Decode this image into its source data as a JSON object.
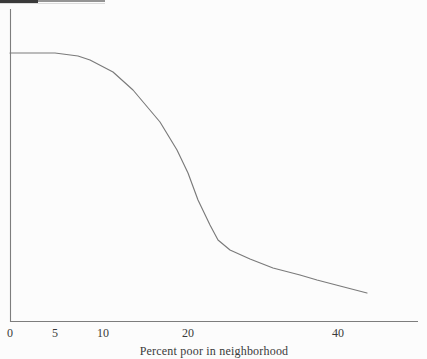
{
  "figure": {
    "background": "#fcfcfc",
    "axes_color": "#7d7d7d",
    "curve_color": "#7a7a7a",
    "text_color": "#3a3a3a",
    "xlabel": "Percent poor in neighborhood",
    "x_ticks": [
      {
        "label": "0",
        "x_px": 10
      },
      {
        "label": "5",
        "x_px": 55
      },
      {
        "label": "10",
        "x_px": 103
      },
      {
        "label": "20",
        "x_px": 188
      },
      {
        "label": "40",
        "x_px": 338
      }
    ],
    "artifact": {
      "dark_color": "#3a3a3a",
      "light_color": "#949494",
      "underline_color": "#dcdcdc"
    },
    "plot": {
      "y_axis": {
        "x_px": 10,
        "y1_px": 9,
        "y2_px": 322
      },
      "x_axis": {
        "y_px": 321,
        "x1_px": 10,
        "x2_px": 418
      },
      "curve_px": [
        [
          10,
          53
        ],
        [
          55,
          53
        ],
        [
          78,
          56
        ],
        [
          90,
          60
        ],
        [
          113,
          72
        ],
        [
          133,
          90
        ],
        [
          160,
          122
        ],
        [
          177,
          150
        ],
        [
          188,
          173
        ],
        [
          198,
          200
        ],
        [
          210,
          225
        ],
        [
          218,
          240
        ],
        [
          230,
          250
        ],
        [
          250,
          259
        ],
        [
          273,
          268
        ],
        [
          300,
          275
        ],
        [
          317,
          280
        ],
        [
          340,
          286
        ],
        [
          367,
          293
        ]
      ]
    }
  },
  "chart_data": {
    "type": "line",
    "title": "",
    "xlabel": "Percent poor in neighborhood",
    "ylabel": "",
    "x_tick_labels": [
      "0",
      "5",
      "10",
      "20",
      "40"
    ],
    "x_scale_note": "tick spacing is non-linear as printed: 0, 5, 10, 20, 40 sit at increasing pixel intervals",
    "grid": false,
    "legend": false,
    "series": [
      {
        "name": "outcome vs neighborhood poverty",
        "x": [
          0,
          5,
          7.4,
          8.6,
          11.2,
          13.5,
          16.7,
          18.7,
          20,
          21.3,
          22.9,
          24,
          25.6,
          28.3,
          31.3,
          34.9,
          37.2,
          40.3,
          43.9
        ],
        "y_relative": [
          0.86,
          0.86,
          0.85,
          0.84,
          0.8,
          0.74,
          0.64,
          0.55,
          0.48,
          0.39,
          0.31,
          0.26,
          0.23,
          0.2,
          0.17,
          0.15,
          0.13,
          0.11,
          0.09
        ],
        "y_note": "y-axis has no visible labels (cropped); values given as fraction of axis height"
      }
    ],
    "shape": "high flat plateau until about 5 percent poor, accelerating decline, steepest drop near 20 percent, long shallow tail out to about 44 percent"
  }
}
